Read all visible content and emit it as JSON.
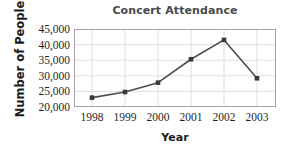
{
  "chart_data": {
    "type": "line",
    "title": "Concert Attendance",
    "xlabel": "Year",
    "ylabel": "Number of People",
    "categories": [
      "1998",
      "1999",
      "2000",
      "2001",
      "2002",
      "2003"
    ],
    "x": [
      1998,
      1999,
      2000,
      2001,
      2002,
      2003
    ],
    "values": [
      23000,
      24800,
      27800,
      35300,
      41500,
      29200
    ],
    "series": [
      {
        "name": "Attendance",
        "values": [
          23000,
          24800,
          27800,
          35300,
          41500,
          29200
        ]
      }
    ],
    "ylim": [
      20000,
      45000
    ],
    "yticks": [
      20000,
      25000,
      30000,
      35000,
      40000,
      45000
    ],
    "ytick_labels": [
      "20,000",
      "25,000",
      "30,000",
      "35,000",
      "40,000",
      "45,000"
    ],
    "xtick_labels": [
      "1998",
      "1999",
      "2000",
      "2001",
      "2002",
      "2003"
    ],
    "grid": true,
    "grid_axis": "both",
    "legend": false,
    "legend_position": "none",
    "marker": "square",
    "line_color": "#4d4d4d",
    "marker_color": "#3a3a3a",
    "grid_color": "#d9d9d9",
    "frame_color": "#a6a6a6",
    "title_color": "#4a4a4a",
    "label_color": "#1c1c1c",
    "background": "#ffffff"
  }
}
